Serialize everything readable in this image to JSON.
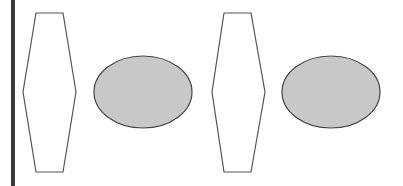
{
  "diagram": {
    "background": "#ffffff",
    "left_bar": {
      "x": 11,
      "y": 0,
      "width": 4,
      "height": 186,
      "color": "#3a3a3a"
    },
    "stroke_color": "#555555",
    "ellipse_fill": "#c8c8c8",
    "shapes": [
      {
        "type": "hexagon",
        "name": "hexagon-1",
        "points": "36,13 63,13 76,92 63,172 36,172 23,92"
      },
      {
        "type": "ellipse",
        "name": "ellipse-1",
        "cx": 143,
        "cy": 92,
        "rx": 49,
        "ry": 36
      },
      {
        "type": "hexagon",
        "name": "hexagon-2",
        "points": "224,13 251,13 265,92 251,172 224,172 212,92"
      },
      {
        "type": "ellipse",
        "name": "ellipse-2",
        "cx": 331,
        "cy": 92,
        "rx": 49,
        "ry": 36
      }
    ]
  }
}
